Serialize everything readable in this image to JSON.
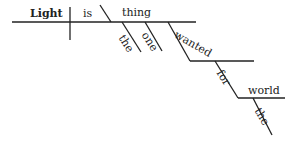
{
  "diagram": {
    "type": "sentence-diagram",
    "sentence": "Light is the one thing wanted for the world",
    "words": {
      "subject": "Light",
      "verb": "is",
      "predicate_nominative": "thing",
      "modifier_the_1": "the",
      "modifier_one": "one",
      "participle_wanted": "wanted",
      "preposition_for": "for",
      "object_world": "world",
      "modifier_the_2": "the"
    },
    "colors": {
      "line": "#222222",
      "text": "#222222",
      "background": "#ffffff"
    }
  }
}
